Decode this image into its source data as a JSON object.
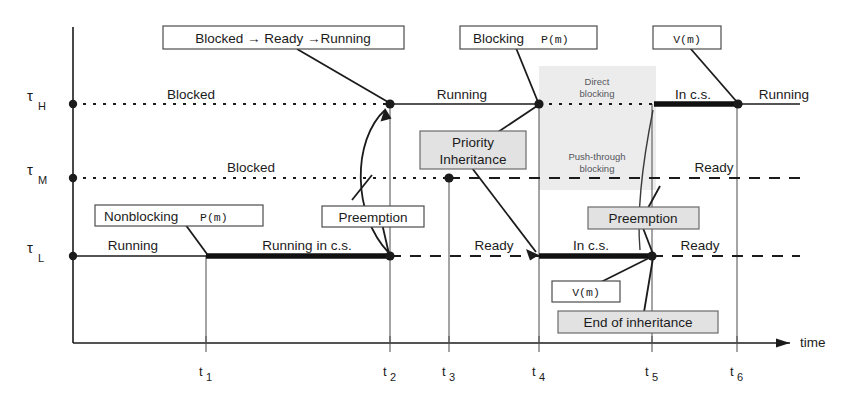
{
  "figure": {
    "type": "timing-diagram",
    "axis": {
      "time_label": "time",
      "ticks": [
        "t1",
        "t2",
        "t3",
        "t4",
        "t5",
        "t6"
      ],
      "tick_subscripts": [
        "1",
        "2",
        "3",
        "4",
        "5",
        "6"
      ]
    },
    "tracks": [
      {
        "id": "tau_h",
        "base": "τ",
        "sub": "H"
      },
      {
        "id": "tau_m",
        "base": "τ",
        "sub": "M"
      },
      {
        "id": "tau_l",
        "base": "τ",
        "sub": "L"
      }
    ],
    "state_labels": {
      "h_blocked": "Blocked",
      "h_running_1": "Running",
      "h_in_cs": "In c.s.",
      "h_running_2": "Running",
      "m_blocked": "Blocked",
      "m_ready": "Ready",
      "l_running": "Running",
      "l_running_in_cs": "Running in c.s.",
      "l_ready_1": "Ready",
      "l_in_cs": "In c.s.",
      "l_ready_2": "Ready"
    },
    "shaded_regions": [
      {
        "id": "direct-blocking",
        "line1": "Direct",
        "line2": "blocking"
      },
      {
        "id": "push-through-blocking",
        "line1": "Push-through",
        "line2": "blocking"
      }
    ],
    "callouts": {
      "blocked_ready_running": "Blocked → Ready →Running",
      "blocking_p": "Blocking",
      "blocking_p_mono": "P(m)",
      "v_m_top": "V(m)",
      "priority_inheritance_l1": "Priority",
      "priority_inheritance_l2": "Inheritance",
      "nonblocking_p": "Nonblocking",
      "nonblocking_p_mono": "P(m)",
      "preemption_left": "Preemption",
      "preemption_right": "Preemption",
      "v_m_bottom": "V(m)",
      "end_of_inheritance": "End of inheritance"
    },
    "colors": {
      "ink": "#1b1b1b",
      "shade": "#ececec",
      "callout_gray": "#e2e2e2",
      "callout_white": "#ffffff",
      "paper": "#ffffff"
    }
  }
}
